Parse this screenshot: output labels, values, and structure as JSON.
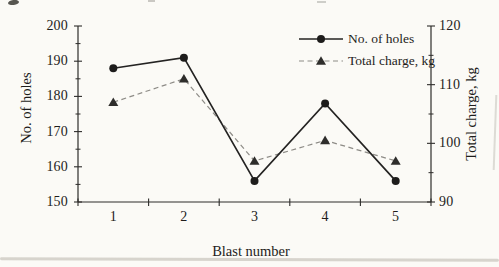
{
  "colors": {
    "background": "#fbfaf6",
    "axis": "#2e2d2b",
    "text": "#1e1d1b",
    "series1_line": "#242322",
    "series1_marker": "#1d1c1b",
    "series2_line": "#8d8b86",
    "series2_marker": "#2e2d2b",
    "artifact": "#b9b5ac"
  },
  "chart_data": {
    "type": "line",
    "title": "",
    "xlabel": "Blast number",
    "x": [
      1,
      2,
      3,
      4,
      5
    ],
    "x_tick_labels": [
      "1",
      "2",
      "3",
      "4",
      "5"
    ],
    "xlim": [
      0.5,
      5.5
    ],
    "x_boundary_ticks": [
      0.5,
      1.5,
      2.5,
      3.5,
      4.5,
      5.5
    ],
    "grid": false,
    "axes": {
      "left": {
        "label": "No. of holes",
        "lim": [
          150,
          200
        ],
        "major_ticks": [
          150,
          160,
          170,
          180,
          190,
          200
        ],
        "minor_ticks": [
          155,
          165,
          175,
          185,
          195
        ]
      },
      "right": {
        "label": "Total charge, kg",
        "lim": [
          90,
          120
        ],
        "major_ticks": [
          90,
          100,
          110,
          120
        ],
        "minor_ticks": [
          95,
          105,
          115
        ]
      }
    },
    "legend": {
      "position": "top-right-inside",
      "entries": [
        "No. of holes",
        "Total charge, kg"
      ]
    },
    "series": [
      {
        "name": "No. of holes",
        "axis": "left",
        "marker": "circle",
        "line": "solid",
        "values": [
          188,
          191,
          156,
          178,
          156
        ]
      },
      {
        "name": "Total charge, kg",
        "axis": "right",
        "marker": "triangle",
        "line": "dashed",
        "values": [
          107,
          111,
          97,
          100.5,
          97
        ]
      }
    ]
  }
}
